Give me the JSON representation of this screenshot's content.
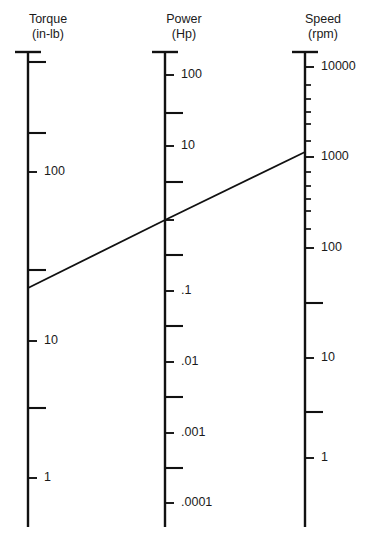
{
  "figure": {
    "type": "nomogram",
    "width": 368,
    "height": 546,
    "background": "#ffffff",
    "line_color": "#111111"
  },
  "axes": [
    {
      "id": "torque",
      "name": "Torque",
      "unit": "(in-lb)",
      "x": 28,
      "top_y": 52,
      "bottom_y": 527,
      "scale": "log10",
      "decade_px": 137,
      "labeled_ticks": [
        {
          "label": "100",
          "y": 172
        },
        {
          "label": "10",
          "y": 341
        },
        {
          "label": "1",
          "y": 478
        }
      ],
      "minor_ticks_y": [
        62,
        133,
        270,
        408
      ],
      "title_x": 48,
      "title_y": 12
    },
    {
      "id": "power",
      "name": "Power",
      "unit": "(Hp)",
      "x": 165,
      "top_y": 52,
      "bottom_y": 527,
      "scale": "log10",
      "decade_px": 71,
      "labeled_ticks": [
        {
          "label": "100",
          "y": 75
        },
        {
          "label": "10",
          "y": 146
        },
        {
          "label": ".1",
          "y": 291
        },
        {
          "label": ".01",
          "y": 362
        },
        {
          "label": ".001",
          "y": 433
        },
        {
          "label": ".0001",
          "y": 503
        }
      ],
      "unlabeled_major_ticks_y": [
        220
      ],
      "minor_ticks_y": [
        113,
        182,
        255,
        326,
        397,
        468
      ],
      "title_x": 184,
      "title_y": 12
    },
    {
      "id": "speed",
      "name": "Speed",
      "unit": "(rpm)",
      "x": 305,
      "top_y": 52,
      "bottom_y": 527,
      "scale": "log10",
      "decade_px": 90,
      "labeled_ticks": [
        {
          "label": "10000",
          "y": 67
        },
        {
          "label": "1000",
          "y": 157
        },
        {
          "label": "100",
          "y": 248
        },
        {
          "label": "10",
          "y": 358
        },
        {
          "label": "1",
          "y": 458
        }
      ],
      "minor_ticks_y": [
        85,
        99,
        112,
        124,
        141,
        172,
        186,
        199,
        211,
        229,
        303,
        412
      ],
      "halfdecade_ticks_y": [
        113,
        203,
        303,
        412
      ],
      "title_x": 323,
      "title_y": 12
    }
  ],
  "index_line": {
    "name": "index-line",
    "points": [
      {
        "axis": "torque",
        "x": 28,
        "y": 288
      },
      {
        "axis": "power",
        "x": 165,
        "y": 220
      },
      {
        "axis": "speed",
        "x": 305,
        "y": 152
      }
    ],
    "stroke_width": 1.8
  }
}
